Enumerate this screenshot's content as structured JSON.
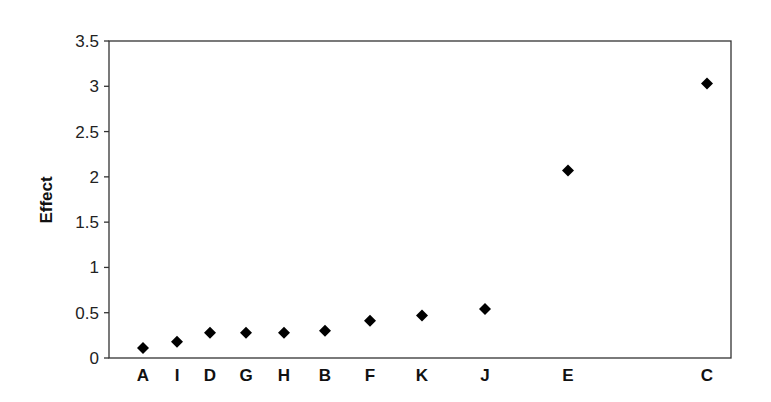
{
  "chart_data": {
    "type": "scatter",
    "title": "",
    "xlabel": "",
    "ylabel": "Effect",
    "ylim": [
      0,
      3.5
    ],
    "yticks": [
      0,
      0.5,
      1,
      1.5,
      2,
      2.5,
      3,
      3.5
    ],
    "ytick_labels": [
      "0",
      "0.5",
      "1",
      "1.5",
      "2",
      "2.5",
      "3",
      "3.5"
    ],
    "grid": false,
    "legend": null,
    "marker": "diamond",
    "marker_color": "#000000",
    "categories": [
      "A",
      "I",
      "D",
      "G",
      "H",
      "B",
      "F",
      "K",
      "J",
      "E",
      "C"
    ],
    "x_positions_px": [
      143,
      177,
      210,
      246,
      284,
      325,
      370,
      422,
      485,
      568,
      707
    ],
    "values": [
      0.11,
      0.18,
      0.28,
      0.28,
      0.28,
      0.3,
      0.41,
      0.47,
      0.54,
      2.07,
      3.03
    ]
  }
}
